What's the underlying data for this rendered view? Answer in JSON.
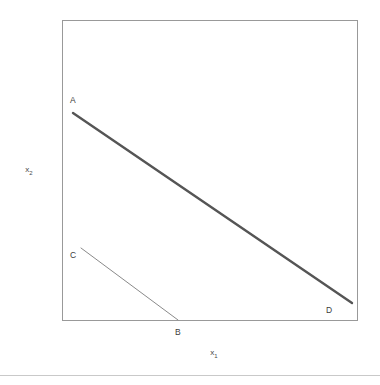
{
  "figure": {
    "background_color": "#ffffff",
    "axis_labels": {
      "x": "x",
      "x_sub": "1",
      "y": "x",
      "y_sub": "2"
    },
    "point_labels": {
      "A": "A",
      "B": "B",
      "C": "C",
      "D": "D"
    },
    "footer_rule_color": "#c9c9c9"
  },
  "chart_data": {
    "type": "line",
    "title": "",
    "xlabel": "x1",
    "ylabel": "x2",
    "grid": false,
    "legend": null,
    "axis_ticks": {
      "x": [],
      "y": []
    },
    "frame": {
      "color": "#999999",
      "line_width": 1,
      "x_px": [
        62,
        357
      ],
      "y_px": [
        20,
        320
      ]
    },
    "annotations": [
      {
        "text": "A",
        "x_px": 73,
        "y_px": 101
      },
      {
        "text": "B",
        "x_px": 178,
        "y_px": 333
      },
      {
        "text": "C",
        "x_px": 73,
        "y_px": 256
      },
      {
        "text": "D",
        "x_px": 329,
        "y_px": 311
      }
    ],
    "series": [
      {
        "name": "AD",
        "label_start": "A",
        "label_end": "D",
        "color": "#555555",
        "line_width": 2.4,
        "points_px": [
          [
            73,
            113
          ],
          [
            352,
            303
          ]
        ]
      },
      {
        "name": "CB",
        "label_start": "C",
        "label_end": "B",
        "color": "#8a8a8a",
        "line_width": 1,
        "points_px": [
          [
            81,
            248
          ],
          [
            178,
            320
          ]
        ]
      }
    ],
    "intersection_px": [
      150,
      262
    ]
  }
}
